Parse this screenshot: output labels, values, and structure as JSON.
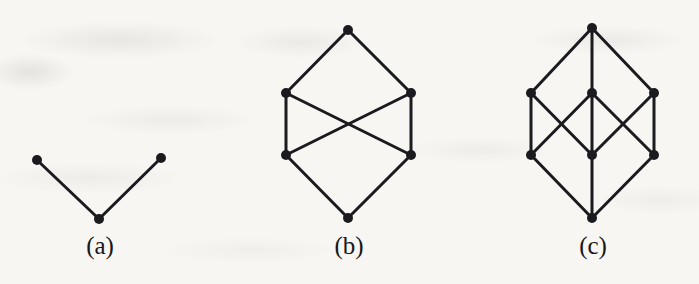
{
  "page": {
    "width": 699,
    "height": 284,
    "background_color": "#f7f6f3",
    "ink_color": "#1b1b1f"
  },
  "figures": [
    {
      "id": "figure-a",
      "caption": "(a)",
      "caption_x": 55,
      "caption_y": 232,
      "vertex_radius": 5.0,
      "edge_width": 3.0,
      "vertices": [
        {
          "name": "a-left",
          "x": 37,
          "y": 160
        },
        {
          "name": "a-right",
          "x": 161,
          "y": 158
        },
        {
          "name": "a-bottom",
          "x": 99,
          "y": 219
        }
      ],
      "edges": [
        {
          "from": 0,
          "to": 2
        },
        {
          "from": 1,
          "to": 2
        }
      ]
    },
    {
      "id": "figure-b",
      "caption": "(b)",
      "caption_x": 304,
      "caption_y": 232,
      "vertex_radius": 5.0,
      "edge_width": 3.0,
      "vertices": [
        {
          "name": "b-top",
          "x": 348,
          "y": 30
        },
        {
          "name": "b-upper-left",
          "x": 286,
          "y": 93
        },
        {
          "name": "b-upper-right",
          "x": 411,
          "y": 93
        },
        {
          "name": "b-lower-left",
          "x": 286,
          "y": 155
        },
        {
          "name": "b-lower-right",
          "x": 411,
          "y": 155
        },
        {
          "name": "b-bottom",
          "x": 348,
          "y": 218
        }
      ],
      "edges": [
        {
          "from": 0,
          "to": 1
        },
        {
          "from": 0,
          "to": 2
        },
        {
          "from": 1,
          "to": 3
        },
        {
          "from": 2,
          "to": 4
        },
        {
          "from": 1,
          "to": 4
        },
        {
          "from": 2,
          "to": 3
        },
        {
          "from": 3,
          "to": 5
        },
        {
          "from": 4,
          "to": 5
        }
      ]
    },
    {
      "id": "figure-c",
      "caption": "(c)",
      "caption_x": 548,
      "caption_y": 232,
      "vertex_radius": 5.0,
      "edge_width": 3.0,
      "vertices": [
        {
          "name": "c-top",
          "x": 592,
          "y": 28
        },
        {
          "name": "c-upper-left",
          "x": 531,
          "y": 93
        },
        {
          "name": "c-center-upper",
          "x": 592,
          "y": 93
        },
        {
          "name": "c-upper-right",
          "x": 654,
          "y": 93
        },
        {
          "name": "c-lower-left",
          "x": 531,
          "y": 155
        },
        {
          "name": "c-center-lower",
          "x": 592,
          "y": 155
        },
        {
          "name": "c-lower-right",
          "x": 654,
          "y": 155
        },
        {
          "name": "c-bottom",
          "x": 592,
          "y": 218
        }
      ],
      "edges": [
        {
          "from": 0,
          "to": 1
        },
        {
          "from": 0,
          "to": 2
        },
        {
          "from": 0,
          "to": 3
        },
        {
          "from": 1,
          "to": 4
        },
        {
          "from": 3,
          "to": 6
        },
        {
          "from": 2,
          "to": 4
        },
        {
          "from": 2,
          "to": 6
        },
        {
          "from": 1,
          "to": 5
        },
        {
          "from": 3,
          "to": 5
        },
        {
          "from": 2,
          "to": 5
        },
        {
          "from": 4,
          "to": 7
        },
        {
          "from": 5,
          "to": 7
        },
        {
          "from": 6,
          "to": 7
        }
      ]
    }
  ]
}
